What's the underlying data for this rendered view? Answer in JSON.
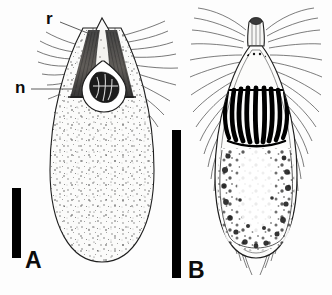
{
  "figure": {
    "background_color": "#fdfdfd",
    "ink_color": "#1a1a1a",
    "panel_count": 2
  },
  "panels": [
    {
      "id": "A",
      "letter": "A",
      "name": "panel-a",
      "description": "Pyriform ciliate, stippled cytoplasm, dark V-shaped oral funnel, rounded posterior",
      "letter_x": 26,
      "letter_y": 250,
      "scalebar": {
        "x": 12,
        "y": 188,
        "width": 9,
        "height": 70,
        "color": "#000000"
      },
      "annotations": [
        {
          "label": "r",
          "name": "annotation-r",
          "x": 47,
          "y": 11,
          "leader_from_x": 58,
          "leader_from_y": 21,
          "leader_to_x": 88,
          "leader_to_y": 33
        },
        {
          "label": "n",
          "name": "annotation-n",
          "x": 16,
          "y": 80,
          "leader_from_x": 29,
          "leader_from_y": 89,
          "leader_to_x": 75,
          "leader_to_y": 89
        }
      ]
    },
    {
      "id": "B",
      "letter": "B",
      "name": "panel-b",
      "description": "Elongate ciliate with apical cap, radiating ciliary crown, bold black striations, granular posterior",
      "letter_x": 189,
      "letter_y": 259,
      "scalebar": {
        "x": 172,
        "y": 130,
        "width": 9,
        "height": 148,
        "color": "#000000"
      },
      "annotations": []
    }
  ],
  "labels": {
    "panel_a": "A",
    "panel_b": "B",
    "annotation_r": "r",
    "annotation_n": "n"
  }
}
